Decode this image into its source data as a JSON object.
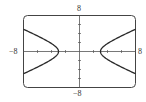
{
  "chart_data": {
    "type": "line",
    "title": "",
    "xlabel": "",
    "ylabel": "",
    "xlim": [
      -8,
      8
    ],
    "ylim": [
      -8,
      8
    ],
    "x_tick_step": 2,
    "y_tick_step": 2,
    "grid": false,
    "legend": null,
    "equation": "x^2/9 - y^2/4 = 1",
    "axis_labels": {
      "top": "8",
      "bottom": "−8",
      "left": "−8",
      "right": "8"
    },
    "series": [
      {
        "name": "right-branch",
        "points": [
          [
            8,
            -4.94
          ],
          [
            6,
            -3.46
          ],
          [
            4,
            -1.76
          ],
          [
            3.5,
            -1.2
          ],
          [
            3.2,
            -0.74
          ],
          [
            3,
            0
          ],
          [
            3.2,
            0.74
          ],
          [
            3.5,
            1.2
          ],
          [
            4,
            1.76
          ],
          [
            6,
            3.46
          ],
          [
            8,
            4.94
          ]
        ]
      },
      {
        "name": "left-branch",
        "points": [
          [
            -8,
            -4.94
          ],
          [
            -6,
            -3.46
          ],
          [
            -4,
            -1.76
          ],
          [
            -3.5,
            -1.2
          ],
          [
            -3.2,
            -0.74
          ],
          [
            -3,
            0
          ],
          [
            -3.2,
            0.74
          ],
          [
            -3.5,
            1.2
          ],
          [
            -4,
            1.76
          ],
          [
            -6,
            3.46
          ],
          [
            -8,
            4.94
          ]
        ]
      }
    ],
    "colors": {
      "curve": "#2a2a2a",
      "axis": "#555555",
      "frame": "#444444"
    }
  }
}
